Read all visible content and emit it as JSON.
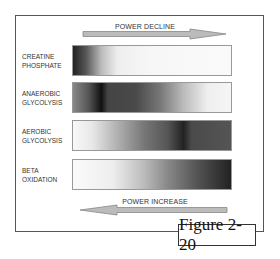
{
  "figure": {
    "label": "Figure 2-20",
    "top_arrow": {
      "label": "POWER DECLINE",
      "direction": "right",
      "icon": "arrow-right-icon"
    },
    "bottom_arrow": {
      "label": "POWER INCREASE",
      "direction": "left",
      "icon": "arrow-left-icon"
    },
    "rows": [
      {
        "label": "CREATINE\nPHOSPHATE",
        "gradient": "dark at left, fades to white quickly"
      },
      {
        "label": "ANAEROBIC\nGLYCOLYSIS",
        "gradient": "darkest band near left (~15%), fades to white at right"
      },
      {
        "label": "AEROBIC\nGLYCOLYSIS",
        "gradient": "white at left, darkest band ~70%, dark gray at right"
      },
      {
        "label": "BETA\nOXIDATION",
        "gradient": "white at left, darkens steadily to dark at right"
      }
    ]
  }
}
